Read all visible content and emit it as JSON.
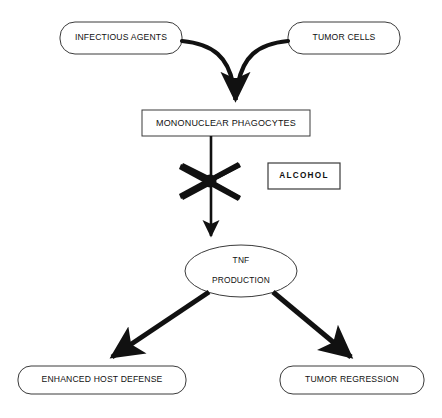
{
  "figure": {
    "background_color": "#ffffff",
    "stroke_color": "#111111",
    "arrow_color": "#111111",
    "title": ""
  },
  "nodes": {
    "infectious_agents": {
      "label": "INFECTIOUS AGENTS",
      "shape": "rounded-rectangle",
      "x": 60,
      "y": 22,
      "width": 122,
      "height": 32
    },
    "tumor_cells": {
      "label": "TUMOR CELLS",
      "shape": "rounded-rectangle",
      "x": 288,
      "y": 22,
      "width": 112,
      "height": 32
    },
    "mononuclear_phagocytes": {
      "label": "MONONUCLEAR PHAGOCYTES",
      "shape": "rectangle",
      "x": 142,
      "y": 110,
      "width": 168,
      "height": 26
    },
    "alcohol": {
      "label": "ALCOHOL",
      "shape": "rectangle",
      "x": 268,
      "y": 163,
      "width": 72,
      "height": 26
    },
    "tnf_production": {
      "label_line1": "TNF",
      "label_line2": "PRODUCTION",
      "shape": "ellipse",
      "cx": 241,
      "cy": 271,
      "rx": 56,
      "ry": 26
    },
    "enhanced_host_defense": {
      "label": "ENHANCED HOST DEFENSE",
      "shape": "rounded-rectangle",
      "x": 18,
      "y": 366,
      "width": 168,
      "height": 28
    },
    "tumor_regression": {
      "label": "TUMOR REGRESSION",
      "shape": "rounded-rectangle",
      "x": 280,
      "y": 366,
      "width": 144,
      "height": 28
    }
  },
  "edges": [
    {
      "id": "infectious-to-phagocytes",
      "from": "infectious_agents",
      "to": "mononuclear_phagocytes",
      "style": "curved",
      "arrowhead": true
    },
    {
      "id": "tumor-cells-to-phagocytes",
      "from": "tumor_cells",
      "to": "mononuclear_phagocytes",
      "style": "curved",
      "arrowhead": true
    },
    {
      "id": "phagocytes-to-tnf",
      "from": "mononuclear_phagocytes",
      "to": "tnf_production",
      "style": "straight",
      "arrowhead": true,
      "blocked": true
    },
    {
      "id": "tnf-to-enhanced-host-defense",
      "from": "tnf_production",
      "to": "enhanced_host_defense",
      "style": "straight",
      "arrowhead": true
    },
    {
      "id": "tnf-to-tumor-regression",
      "from": "tnf_production",
      "to": "tumor_regression",
      "style": "straight",
      "arrowhead": true
    }
  ],
  "annotations": {
    "inhibition_marker": {
      "name": "inhibition-cross",
      "meaning": "blocked / inhibited pathway",
      "cx": 211,
      "cy": 180
    }
  }
}
